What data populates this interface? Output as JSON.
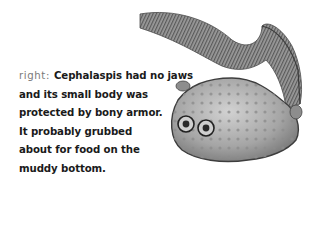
{
  "caption": {
    "lead": "right:",
    "lines": [
      "Cephalaspis had no jaws",
      "and its small body was",
      "protected by bony armor.",
      "It probably grubbed",
      "about for food on the",
      "muddy bottom."
    ]
  },
  "illustration": {
    "subject": "Cephalaspis fossil fish",
    "style": "grayscale engraving"
  }
}
